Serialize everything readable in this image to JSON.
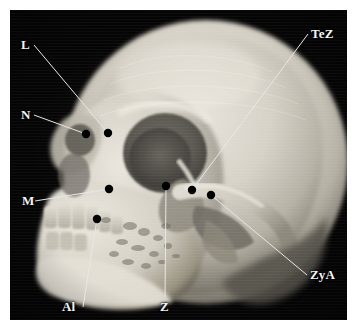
{
  "figure": {
    "type": "ct-volume-rendered-skull-photo",
    "view": "oblique anterolateral (three-quarter) view of a human skull",
    "modality": "3D CT volume rendering",
    "background_color": "#050505",
    "bone_color": "#d9d5cc",
    "label_color": "#f4f4f4",
    "leader_line_color": "#e8e8e8",
    "marker_color": "#000000",
    "frame": {
      "x": 10,
      "y": 10,
      "width": 337,
      "height": 310
    }
  },
  "landmarks": [
    {
      "id": "L",
      "label": "L",
      "name": "lacrimale",
      "label_pos": {
        "x": 21,
        "y": 38
      },
      "marker": {
        "x": 108,
        "y": 133
      },
      "line_color": "#e8e8e8"
    },
    {
      "id": "N",
      "label": "N",
      "name": "nasion",
      "label_pos": {
        "x": 21,
        "y": 108
      },
      "marker": {
        "x": 86,
        "y": 134
      },
      "line_color": "#e8e8e8"
    },
    {
      "id": "M",
      "label": "M",
      "name": "maxillofrontale",
      "label_pos": {
        "x": 22,
        "y": 194
      },
      "marker": {
        "x": 109,
        "y": 189
      },
      "line_color": "#e8e8e8"
    },
    {
      "id": "Al",
      "label": "Al",
      "name": "alare",
      "label_pos": {
        "x": 62,
        "y": 300
      },
      "marker": {
        "x": 97,
        "y": 219
      },
      "line_color": "#e8e8e8"
    },
    {
      "id": "Z",
      "label": "Z",
      "name": "zygion",
      "label_pos": {
        "x": 160,
        "y": 300
      },
      "marker": {
        "x": 166,
        "y": 186
      },
      "line_color": "#e8e8e8"
    },
    {
      "id": "TeZ",
      "label": "TeZ",
      "name": "temporozygomatic suture point",
      "label_pos": {
        "x": 311,
        "y": 27
      },
      "marker": {
        "x": 192,
        "y": 190
      },
      "line_color": "#e8e8e8"
    },
    {
      "id": "ZyA",
      "label": "ZyA",
      "name": "zygomatic arch point",
      "label_pos": {
        "x": 310,
        "y": 268
      },
      "marker": {
        "x": 211,
        "y": 195
      },
      "line_color": "#e8e8e8"
    }
  ]
}
